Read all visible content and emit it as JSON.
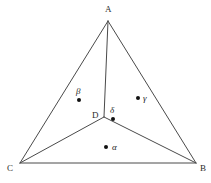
{
  "figure": {
    "background_color": "#ffffff",
    "line_color": "#4a4a4a",
    "line_width": 1,
    "width": 211,
    "height": 183
  },
  "vertices": [
    {
      "name": "A",
      "label": "A",
      "x": 108,
      "y": 21,
      "label_x": 105,
      "label_y": 5
    },
    {
      "name": "B",
      "label": "B",
      "x": 196,
      "y": 163,
      "label_x": 200,
      "label_y": 164
    },
    {
      "name": "C",
      "label": "C",
      "x": 20,
      "y": 163,
      "label_x": 7,
      "label_y": 164
    },
    {
      "name": "D",
      "label": "D",
      "x": 104,
      "y": 117,
      "label_x": 92,
      "label_y": 111
    }
  ],
  "edges": [
    {
      "name": "side-AB",
      "from": "A",
      "to": "B"
    },
    {
      "name": "side-BC",
      "from": "B",
      "to": "C"
    },
    {
      "name": "side-CA",
      "from": "C",
      "to": "A"
    },
    {
      "name": "cevian-DA",
      "from": "D",
      "to": "A"
    },
    {
      "name": "cevian-DB",
      "from": "D",
      "to": "B"
    },
    {
      "name": "cevian-DC",
      "from": "D",
      "to": "C"
    }
  ],
  "regions": [
    {
      "name": "alpha",
      "label": "α",
      "dot_x": 106,
      "dot_y": 147,
      "label_x": 112,
      "label_y": 143,
      "dot_side": "left"
    },
    {
      "name": "beta",
      "label": "β",
      "dot_x": 79,
      "dot_y": 100,
      "label_x": 76,
      "label_y": 87,
      "dot_side": "below"
    },
    {
      "name": "gamma",
      "label": "γ",
      "dot_x": 138,
      "dot_y": 98,
      "label_x": 143,
      "label_y": 94,
      "dot_side": "left"
    },
    {
      "name": "delta",
      "label": "δ",
      "dot_x": 113,
      "dot_y": 119,
      "label_x": 110,
      "label_y": 106,
      "dot_side": "below"
    }
  ],
  "dot": {
    "radius": 2,
    "color": "#111111"
  }
}
